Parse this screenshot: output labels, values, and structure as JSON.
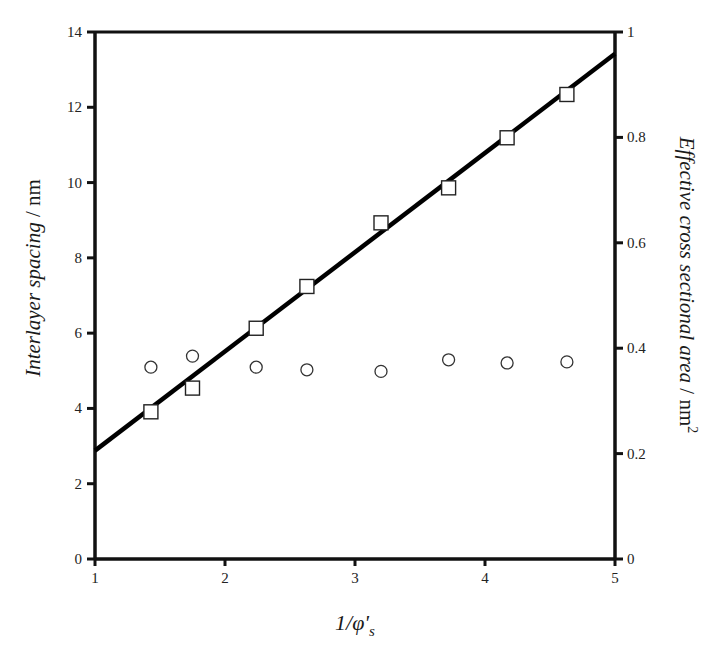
{
  "chart_data": {
    "type": "scatter",
    "title": "",
    "xlabel": "1/φ's",
    "ylabel": "Interlayer spacing / nm",
    "ylabel_right": "Effective cross sectional area / nm2",
    "xlim": [
      1,
      5
    ],
    "ylim": [
      0,
      14
    ],
    "ylim_right": [
      0,
      1
    ],
    "grid": false,
    "legend": null,
    "x_ticks": [
      "1",
      "2",
      "3",
      "4",
      "5"
    ],
    "y_ticks": [
      "0",
      "2",
      "4",
      "6",
      "8",
      "10",
      "12",
      "14"
    ],
    "y_ticks_right": [
      "0",
      "0.2",
      "0.4",
      "0.6",
      "0.8",
      "1"
    ],
    "series": [
      {
        "name": "Interlayer spacing",
        "marker": "square-open",
        "axis": "left",
        "x": [
          1.43,
          1.75,
          2.24,
          2.63,
          3.2,
          3.72,
          4.17,
          4.63
        ],
        "y": [
          3.91,
          4.54,
          6.13,
          7.24,
          8.93,
          9.86,
          11.19,
          12.34
        ]
      },
      {
        "name": "Effective cross sectional area",
        "marker": "circle-open",
        "axis": "right",
        "x": [
          1.43,
          1.75,
          2.24,
          2.63,
          3.2,
          3.72,
          4.17,
          4.63
        ],
        "y": [
          0.364,
          0.385,
          0.364,
          0.359,
          0.356,
          0.378,
          0.372,
          0.374
        ]
      },
      {
        "name": "Linear fit",
        "type": "line",
        "axis": "left",
        "x": [
          1,
          5
        ],
        "y": [
          2.88,
          13.42
        ]
      }
    ]
  },
  "labels": {
    "ylabel_left_italic": "Interlayer spacing",
    "ylabel_left_unit": " / nm",
    "ylabel_right_italic": "Effective cross sectional area",
    "ylabel_right_unit": " / nm",
    "ylabel_right_sup": "2",
    "xlabel_main": "1/φ'",
    "xlabel_sub": "s"
  }
}
